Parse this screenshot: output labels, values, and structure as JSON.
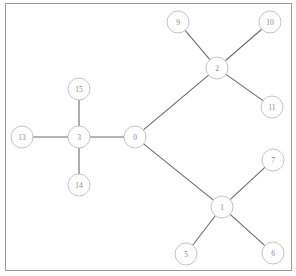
{
  "figure": {
    "title": "",
    "frame": {
      "x": 5,
      "y": 3,
      "width": 286,
      "height": 267,
      "stroke": "#9a9a9a"
    },
    "background": "#ffffff",
    "node_fill": "#ffffff",
    "node_stroke": "#bdbdbd",
    "edge_stroke": "#6b6b6b",
    "label_color": "#8a8a8a",
    "node_radius": 11
  },
  "chart_data": {
    "type": "diagram",
    "subtype": "node-link-tree",
    "title": "",
    "xlabel": "",
    "ylabel": "",
    "grid": false,
    "legend": null,
    "directed": false,
    "node_count": 13,
    "edge_count": 12,
    "nodes": [
      {
        "id": "0",
        "label": "0",
        "x": 135,
        "y": 137
      },
      {
        "id": "3",
        "label": "3",
        "x": 79,
        "y": 137
      },
      {
        "id": "13",
        "label": "13",
        "x": 22,
        "y": 137
      },
      {
        "id": "15",
        "label": "15",
        "x": 79,
        "y": 89
      },
      {
        "id": "14",
        "label": "14",
        "x": 79,
        "y": 185
      },
      {
        "id": "2",
        "label": "2",
        "x": 217,
        "y": 68
      },
      {
        "id": "9",
        "label": "9",
        "x": 178,
        "y": 22
      },
      {
        "id": "10",
        "label": "10",
        "x": 270,
        "y": 22
      },
      {
        "id": "11",
        "label": "11",
        "x": 272,
        "y": 107
      },
      {
        "id": "1",
        "label": "1",
        "x": 222,
        "y": 207
      },
      {
        "id": "7",
        "label": "7",
        "x": 273,
        "y": 160
      },
      {
        "id": "5",
        "label": "5",
        "x": 186,
        "y": 254
      },
      {
        "id": "6",
        "label": "6",
        "x": 273,
        "y": 253
      }
    ],
    "edges": [
      {
        "source": "0",
        "target": "3"
      },
      {
        "source": "0",
        "target": "2"
      },
      {
        "source": "0",
        "target": "1"
      },
      {
        "source": "3",
        "target": "13"
      },
      {
        "source": "3",
        "target": "15"
      },
      {
        "source": "3",
        "target": "14"
      },
      {
        "source": "2",
        "target": "9"
      },
      {
        "source": "2",
        "target": "10"
      },
      {
        "source": "2",
        "target": "11"
      },
      {
        "source": "1",
        "target": "7"
      },
      {
        "source": "1",
        "target": "5"
      },
      {
        "source": "1",
        "target": "6"
      }
    ]
  }
}
